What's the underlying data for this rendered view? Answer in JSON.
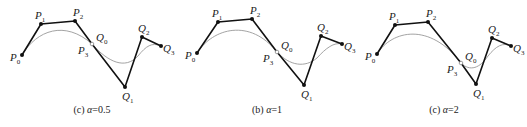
{
  "figure": {
    "panels": [
      {
        "caption_prefix": "(c) ",
        "caption_param": "α",
        "caption_value": "=0.5",
        "points": {
          "P0": [
            22,
            55
          ],
          "P1": [
            41,
            24
          ],
          "P2": [
            75,
            21
          ],
          "P3": [
            92,
            44
          ],
          "Q1": [
            125,
            87
          ],
          "Q2": [
            142,
            37
          ],
          "Q3": [
            161,
            46
          ]
        },
        "curve1": "M22,55 C37,30 65,20 92,44",
        "curve2": "M92,44 C108,62 125,70 138,56 C146,46 152,42 161,46",
        "caption_x": 92
      },
      {
        "caption_prefix": "(b) ",
        "caption_param": "α",
        "caption_value": "=1",
        "points": {
          "P0": [
            197,
            53
          ],
          "P1": [
            218,
            22
          ],
          "P2": [
            252,
            19
          ],
          "P3": [
            277,
            52
          ],
          "Q1": [
            304,
            85
          ],
          "Q2": [
            321,
            36
          ],
          "Q3": [
            342,
            44
          ]
        },
        "curve1": "M197,53 C213,28 250,18 277,52",
        "curve2": "M277,52 C290,66 305,68 317,58 C326,48 334,42 342,44",
        "caption_x": 267
      },
      {
        "caption_prefix": "(c) ",
        "caption_param": "α",
        "caption_value": "=2",
        "points": {
          "P0": [
            377,
            54
          ],
          "P1": [
            395,
            25
          ],
          "P2": [
            428,
            22
          ],
          "P3": [
            461,
            63
          ],
          "Q1": [
            476,
            84
          ],
          "Q2": [
            492,
            38
          ],
          "Q3": [
            511,
            46
          ]
        },
        "curve1": "M377,54 C392,30 430,22 461,63",
        "curve2": "M461,63 C470,72 480,68 488,56 C496,46 503,42 511,46",
        "caption_x": 444
      }
    ],
    "labels": [
      "P",
      "Q"
    ],
    "caption_y": 113
  }
}
